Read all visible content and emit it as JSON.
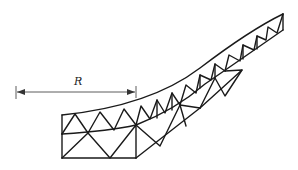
{
  "figure": {
    "type": "truss-arch-schematic",
    "dimension": {
      "label": "R",
      "description": "radius / span dimension from left reference line to truss joint"
    },
    "colors": {
      "line": "#1a1a1a",
      "dimension_line": "#333333",
      "background": "#ffffff"
    }
  }
}
